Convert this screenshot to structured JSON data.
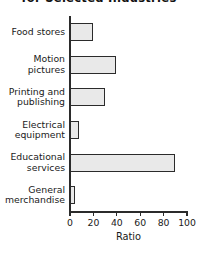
{
  "chart_data": {
    "type": "bar",
    "orientation": "horizontal",
    "title": "for Selected Industries",
    "title_clipped": true,
    "categories": [
      "Food stores",
      "Motion pictures",
      "Printing and publishing",
      "Electrical equipment",
      "Educational services",
      "General merchandise"
    ],
    "values": [
      20,
      39,
      30,
      8,
      90,
      4
    ],
    "xlabel": "Ratio",
    "ylabel": "",
    "xlim": [
      0,
      100
    ],
    "xticks": [
      0,
      20,
      40,
      60,
      80,
      100
    ],
    "xtick_labels": [
      "0",
      "20",
      "40",
      "60",
      "80",
      "100"
    ],
    "grid": false,
    "legend": false,
    "bar_fill_color": "#e9e9e9",
    "bar_edge_color": "#2b2b2b",
    "axis_color": "#2b2b2b",
    "background_color": "#ffffff"
  }
}
